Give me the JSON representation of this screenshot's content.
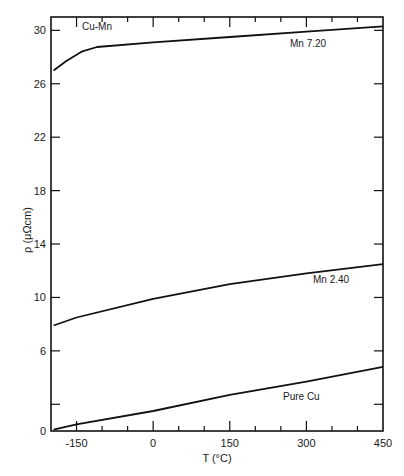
{
  "chart_data": {
    "type": "line",
    "title": "",
    "system_label": "Cu-Mn",
    "xlabel": "T (°C)",
    "ylabel": "ρ (μΩcm)",
    "xlim": [
      -200,
      450
    ],
    "ylim": [
      0,
      31
    ],
    "x_ticks": [
      -150,
      0,
      150,
      300,
      450
    ],
    "x_tick_labels": [
      "-150",
      "0",
      "150",
      "300",
      "450"
    ],
    "y_ticks": [
      0,
      6,
      10,
      14,
      18,
      22,
      26,
      30
    ],
    "y_tick_labels": [
      "0",
      "6",
      "10",
      "14",
      "18",
      "22",
      "26",
      "30"
    ],
    "grid": false,
    "legend": "inline labels",
    "series": [
      {
        "name": "Mn 7.20",
        "label": "Mn  7.20",
        "x": [
          -195,
          -170,
          -140,
          -110,
          0,
          150,
          300,
          450
        ],
        "y": [
          27.0,
          27.7,
          28.4,
          28.75,
          29.1,
          29.5,
          29.9,
          30.3
        ]
      },
      {
        "name": "Mn 2.40",
        "label": "Mn  2.40",
        "x": [
          -195,
          -150,
          0,
          150,
          300,
          450
        ],
        "y": [
          7.9,
          8.5,
          9.9,
          11.0,
          11.8,
          12.5
        ]
      },
      {
        "name": "Pure Cu",
        "label": "Pure  Cu",
        "x": [
          -195,
          -150,
          0,
          150,
          300,
          450
        ],
        "y": [
          0.1,
          0.5,
          1.5,
          2.7,
          3.7,
          4.8
        ]
      }
    ]
  }
}
